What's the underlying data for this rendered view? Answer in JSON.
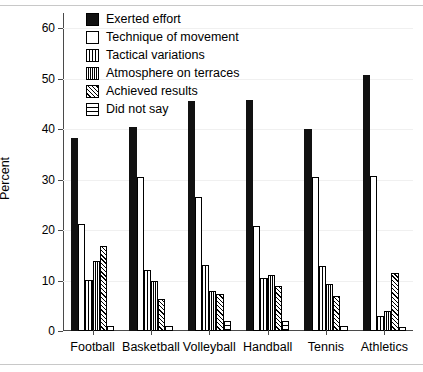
{
  "chart_data": {
    "type": "bar",
    "title": "",
    "subtitle": "",
    "xlabel": "",
    "ylabel": "Percent",
    "ylim": [
      0,
      63
    ],
    "yticks": [
      0,
      10,
      20,
      30,
      40,
      50,
      60
    ],
    "ytick_labels": [
      "0",
      "10",
      "20",
      "30",
      "40",
      "50",
      "60"
    ],
    "grid": true,
    "legend_position": "top-left-inside",
    "categories": [
      "Football",
      "Basketball",
      "Volleyball",
      "Handball",
      "Tennis",
      "Athletics"
    ],
    "series": [
      {
        "name": "Exerted effort",
        "pattern": "solid-black",
        "values": [
          38.2,
          40.4,
          45.5,
          45.8,
          40.0,
          50.8
        ]
      },
      {
        "name": "Technique of movement",
        "pattern": "empty-white",
        "values": [
          21.2,
          30.6,
          26.5,
          20.8,
          30.5,
          30.8
        ]
      },
      {
        "name": "Tactical variations",
        "pattern": "vertical-lines-wide",
        "values": [
          10.1,
          12.0,
          13.0,
          10.5,
          12.9,
          3.0
        ]
      },
      {
        "name": "Atmosphere on terraces",
        "pattern": "vertical-lines-dense",
        "values": [
          13.8,
          10.0,
          8.0,
          11.0,
          9.4,
          3.9
        ]
      },
      {
        "name": "Achieved results",
        "pattern": "diagonal-hatch",
        "values": [
          16.8,
          6.4,
          7.4,
          9.0,
          7.0,
          11.5
        ]
      },
      {
        "name": "Did not say",
        "pattern": "horizontal-lines",
        "values": [
          1.0,
          1.0,
          2.0,
          2.0,
          1.0,
          0.8
        ]
      }
    ]
  },
  "legend": {
    "items": [
      {
        "label": "Exerted effort"
      },
      {
        "label": "Technique of movement"
      },
      {
        "label": "Tactical variations"
      },
      {
        "label": "Atmosphere on terraces"
      },
      {
        "label": "Achieved results"
      },
      {
        "label": "Did not say"
      }
    ]
  },
  "colors": {
    "bar_black": "#111111",
    "bar_white": "#ffffff",
    "outline": "#000000",
    "axis": "#4a4a4a",
    "gridline": "#f0f0f0",
    "rule": "#c8c8c8"
  }
}
